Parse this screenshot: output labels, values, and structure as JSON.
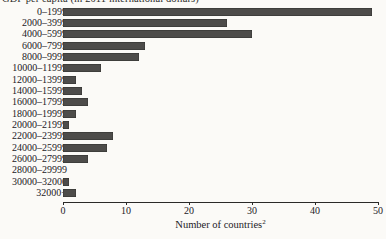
{
  "figure": {
    "caption": "GDP per capita (in 2011 international dollars)",
    "x_axis_label": "Number of countries",
    "x_axis_label_superscript": "2",
    "bar_color": "#4d4c4a",
    "background_color": "#fbfaf7"
  },
  "chart_data": {
    "type": "bar",
    "orientation": "horizontal",
    "title": "GDP per capita (in 2011 international dollars)",
    "xlabel": "Number of countries",
    "ylabel": "GDP per capita (in 2011 international dollars)",
    "xlim": [
      0,
      50
    ],
    "xticks": [
      0,
      10,
      20,
      30,
      40,
      50
    ],
    "xtick_labels": [
      "0",
      "10",
      "20",
      "30",
      "40",
      "50"
    ],
    "grid": false,
    "legend": null,
    "categories": [
      "0–1999",
      "2000–3999",
      "4000–5999",
      "6000–7999",
      "8000–9999",
      "10000–11999",
      "12000–13999",
      "14000–15999",
      "16000–17999",
      "18000–19999",
      "20000–21999",
      "22000–23999",
      "24000–25999",
      "26000–27999",
      "28000–29999",
      "30000–32000",
      "32000+"
    ],
    "values": [
      49,
      26,
      30,
      13,
      12,
      6,
      2,
      3,
      4,
      2,
      1,
      8,
      7,
      4,
      0,
      1,
      2
    ]
  }
}
